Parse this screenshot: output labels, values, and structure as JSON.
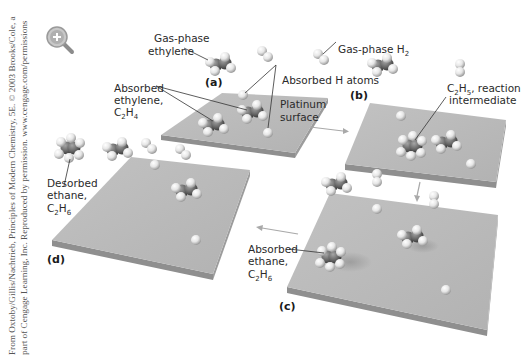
{
  "credit": {
    "line1": "From Oxtoby/Gillis/Nachtrieb, Principles of Modern Chemistry, 5E. © 2003 Brooks/Cole, a",
    "line2": "part of Cengage Learning, Inc. Reproduced by permission. www.cengage.com/permissions"
  },
  "zoom_icon": "magnifier-plus-icon",
  "panels": {
    "a": "(a)",
    "b": "(b)",
    "c": "(c)",
    "d": "(d)"
  },
  "labels": {
    "gas_ethylene": [
      "Gas-phase",
      "ethylene"
    ],
    "gas_h2": {
      "text": "Gas-phase H",
      "sub": "2"
    },
    "absorbed_ethylene": {
      "l1": "Absorbed",
      "l2": "ethylene,",
      "formula": "C",
      "s1": "2",
      "h": "H",
      "s2": "4"
    },
    "absorbed_h": "Absorbed H atoms",
    "platinum": [
      "Platinum",
      "surface"
    ],
    "c2h5": {
      "c": "C",
      "s1": "2",
      "h": "H",
      "s2": "5",
      "rest": ", reaction",
      "l2": "intermediate"
    },
    "desorbed_ethane": {
      "l1": "Desorbed",
      "l2": "ethane,",
      "c": "C",
      "s1": "2",
      "h": "H",
      "s2": "6"
    },
    "absorbed_ethane": {
      "l1": "Absorbed",
      "l2": "ethane,",
      "c": "C",
      "s1": "2",
      "h": "H",
      "s2": "6"
    }
  },
  "colors": {
    "plate_top": "#b9b9b9",
    "plate_edge": "#8e8e8e",
    "carbon": "#6e6e6e",
    "hydrogen": "#eeeeee",
    "arrow": "#a9a9a9",
    "text": "#2a2a2a"
  }
}
